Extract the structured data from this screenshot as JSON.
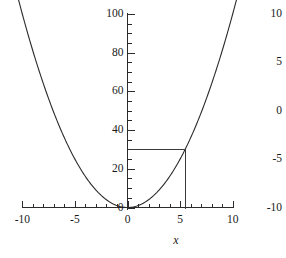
{
  "chart_data": {
    "type": "line",
    "title": "",
    "subtitle": "",
    "xlabel": "x",
    "ylabel": "",
    "function": "y = x^2",
    "grid": false,
    "legend": false,
    "xlim": [
      -10,
      10
    ],
    "ylim": [
      0,
      105
    ],
    "x_ticks": [
      -10,
      -5,
      0,
      5,
      10
    ],
    "x_tick_labels": [
      "-10",
      "-5",
      "0",
      "5",
      "10"
    ],
    "x_minor_step": 1,
    "y_ticks": [
      0,
      20,
      40,
      60,
      80,
      100
    ],
    "y_tick_labels": [
      "0",
      "20",
      "40",
      "60",
      "80",
      "100"
    ],
    "y_minor_step": 5,
    "right_axis": {
      "ticks": [
        10,
        5,
        0,
        -5,
        -10
      ],
      "tick_labels": [
        "10",
        "5",
        "0",
        "-5",
        "-10"
      ],
      "lim": [
        -10,
        10
      ],
      "has_line": false
    },
    "series": [
      {
        "name": "y = x^2",
        "type": "line",
        "color": "#2b2b2b",
        "x": [
          -10.4,
          -10,
          -9.5,
          -9,
          -8.5,
          -8,
          -7.5,
          -7,
          -6.5,
          -6,
          -5.5,
          -5,
          -4.5,
          -4,
          -3.5,
          -3,
          -2.5,
          -2,
          -1.5,
          -1,
          -0.5,
          0,
          0.5,
          1,
          1.5,
          2,
          2.5,
          3,
          3.5,
          4,
          4.5,
          5,
          5.5,
          6,
          6.5,
          7,
          7.5,
          8,
          8.5,
          9,
          9.5,
          10,
          10.4
        ],
        "y": [
          108.16,
          100,
          90.25,
          81,
          72.25,
          64,
          56.25,
          49,
          42.25,
          36,
          30.25,
          25,
          20.25,
          16,
          12.25,
          9,
          6.25,
          4,
          2.25,
          1,
          0.25,
          0,
          0.25,
          1,
          2.25,
          4,
          6.25,
          9,
          12.25,
          16,
          20.25,
          25,
          30.25,
          36,
          42.25,
          49,
          56.25,
          64,
          72.25,
          81,
          90.25,
          100,
          108.16
        ]
      }
    ],
    "annotations": [
      {
        "name": "solution-guide-lines",
        "type": "corner-lines",
        "point": {
          "x": 5.5,
          "y": 30.25
        },
        "horizontal_from_x": 0,
        "vertical_to_y": 0,
        "color": "#3a3a3a"
      }
    ]
  },
  "axes": {
    "x_title": "x"
  }
}
